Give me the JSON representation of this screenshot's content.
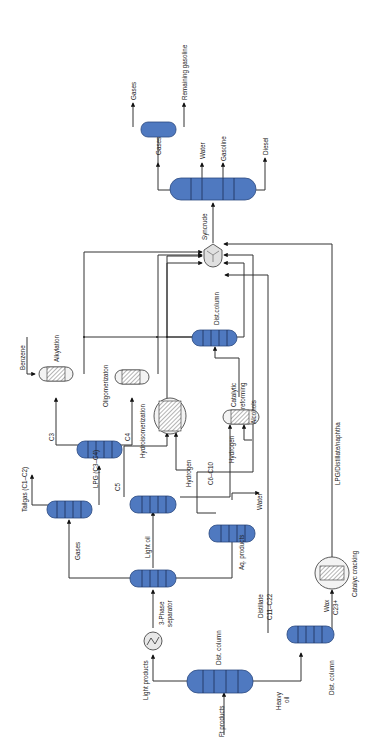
{
  "diagram": {
    "orientation": "rotated 90 degrees counterclockwise",
    "colors": {
      "column_fill": "#4f79c0",
      "column_stroke": "#2c4a80",
      "line": "#333333",
      "reactor_fill": "#f3f3f3"
    },
    "labels": {
      "ft_products": "Ft products",
      "dist_column_1": "Dist. column",
      "light_products": "Light products",
      "phase_sep_line1": "3-Phase",
      "phase_sep_line2": "separator",
      "heavy_oil_line1": "Heavy",
      "heavy_oil_line2": "oil",
      "dist_column_2": "Dist. column",
      "distillate_line1": "Distillate",
      "distillate_line2": "C11–C22",
      "wax_line1": "Wax",
      "wax_line2": "C23+",
      "catalytic_cracking": "Catalyc cracking",
      "lpg_distillate_naphtha": "LPG/Distillate/naphtha",
      "gases_1": "Gases",
      "light_oil": "Light oil",
      "aq_products": "Aq. products",
      "water_1": "Water",
      "alcohols": "Alcohols",
      "tailgas": "Tailgas (C1–C2)",
      "lpg": "LPG (C3–C4)",
      "c3": "C3",
      "c4": "C4",
      "c5": "C5",
      "c6_c10": "C6–C10",
      "hydrogen_1": "Hydrogen",
      "hydrogen_2": "Hydrogen",
      "hydroisomerization": "Hydroisomerization",
      "catalytic_reforming_line1": "Catalytic",
      "catalytic_reforming_line2": "reforming",
      "oligomerization": "Oligomerizaton",
      "alkylation": "Alkylation",
      "benzene": "Benzene",
      "dist_column_3": "Dist.column",
      "syncrude": "Syncrude",
      "gases_2": "Gases",
      "water_2": "Water",
      "gasoline": "Gasoline",
      "diesel": "Diesel",
      "gases_3": "Gases",
      "remaining_gasoline": "Remaining gasoline"
    }
  }
}
